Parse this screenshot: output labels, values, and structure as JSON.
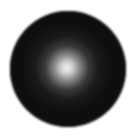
{
  "image": {
    "description": "Dark sphere with soft bright radial highlight",
    "background_color": "#ffffff",
    "sphere_color": "#0e0e0e",
    "highlight_color": "#f4f4f4",
    "mid_color": "#3a3a3a"
  }
}
